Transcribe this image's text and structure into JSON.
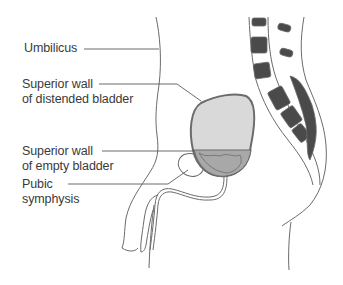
{
  "figure": {
    "labels": [
      {
        "id": "umbilicus",
        "lines": [
          "Umbilicus"
        ]
      },
      {
        "id": "superior-wall-distended",
        "lines": [
          "Superior wall",
          "of distended bladder"
        ]
      },
      {
        "id": "superior-wall-empty",
        "lines": [
          "Superior wall",
          "of empty bladder"
        ]
      },
      {
        "id": "pubic-symphysis",
        "lines": [
          "Pubic",
          "symphysis"
        ]
      }
    ]
  },
  "colors": {
    "outline": "#6b6b6b",
    "bladder_distended_fill": "#d9d9d9",
    "bladder_empty_fill": "#a8a8a8",
    "bone_fill": "#4a4a4a",
    "text": "#3a3a3a",
    "leader": "#5a5a5a"
  }
}
